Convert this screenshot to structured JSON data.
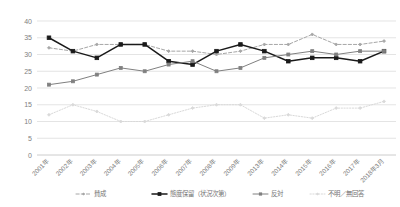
{
  "chart_data": {
    "type": "line",
    "title": "",
    "xlabel": "",
    "ylabel": "",
    "ylim": [
      0,
      40
    ],
    "ytick_step": 5,
    "yticks": [
      "0",
      "5",
      "10",
      "15",
      "20",
      "25",
      "30",
      "35",
      "40"
    ],
    "grid": true,
    "legend_position": "bottom",
    "categories": [
      "2001年",
      "2002年",
      "2003年",
      "2004年",
      "2005年",
      "2006年",
      "2007年",
      "2008年",
      "2009年",
      "2013年",
      "2014年",
      "2015年",
      "2016年",
      "2017年",
      "2018年3月"
    ],
    "series": [
      {
        "name": "賛成",
        "color": "#a6a6a6",
        "style": "dashed",
        "marker": "diamond",
        "values": [
          32,
          31,
          33,
          33,
          33,
          31,
          31,
          30,
          31,
          33,
          33,
          36,
          33,
          33,
          34
        ]
      },
      {
        "name": "態度保留（状況次第）",
        "color": "#1a1a1a",
        "style": "solid",
        "marker": "square",
        "values": [
          35,
          31,
          29,
          33,
          33,
          28,
          27,
          31,
          33,
          31,
          28,
          29,
          29,
          28,
          31
        ]
      },
      {
        "name": "反対",
        "color": "#808080",
        "style": "solid",
        "marker": "square",
        "values": [
          21,
          22,
          24,
          26,
          25,
          27,
          28,
          25,
          26,
          29,
          30,
          31,
          30,
          31,
          31
        ]
      },
      {
        "name": "不明／無回答",
        "color": "#d9d9d9",
        "style": "dotted",
        "marker": "diamond",
        "values": [
          12,
          15,
          13,
          10,
          10,
          12,
          14,
          15,
          15,
          11,
          12,
          11,
          14,
          14,
          16
        ]
      }
    ]
  },
  "legend": {
    "items": [
      {
        "label": "賛成"
      },
      {
        "label": "態度保留（状況次第）"
      },
      {
        "label": "反対"
      },
      {
        "label": "不明／無回答"
      }
    ]
  }
}
